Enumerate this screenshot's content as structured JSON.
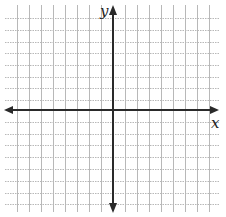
{
  "diagram": {
    "type": "coordinate-plane",
    "x_axis_label": "x",
    "y_axis_label": "y",
    "grid": {
      "vertical_lines_x": [
        17,
        29,
        41,
        53,
        65,
        77,
        89,
        101,
        125,
        137,
        149,
        161,
        173,
        185,
        197,
        209
      ],
      "horizontal_lines_y": [
        18,
        30,
        42,
        53,
        65,
        77,
        88,
        100,
        122,
        134,
        145,
        157,
        169,
        181,
        193,
        204
      ],
      "x_extent": [
        5,
        220
      ],
      "y_extent": [
        5,
        212
      ],
      "spacing_px": 12
    },
    "axes": {
      "x_axis_y": 110,
      "y_axis_x": 113,
      "x_axis_range": [
        4,
        219
      ],
      "y_axis_range": [
        5,
        213
      ],
      "arrows": [
        "left",
        "right",
        "up",
        "down"
      ]
    },
    "colors": {
      "background": "#ffffff",
      "grid_line": "#b8b8b8",
      "axis": "#2a2a2a",
      "label": "#222222"
    }
  }
}
